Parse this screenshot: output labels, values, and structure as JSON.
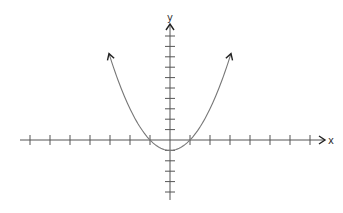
{
  "chart_data": {
    "type": "line",
    "title": "",
    "function": "y = x^2 - 1",
    "xlabel": "x",
    "ylabel": "y",
    "xlim": [
      -7.5,
      7.8
    ],
    "ylim": [
      -5.8,
      11
    ],
    "x_ticks": [
      -7,
      -6,
      -5,
      -4,
      -3,
      -2,
      -1,
      1,
      2,
      3,
      4,
      5,
      6,
      7
    ],
    "y_ticks": [
      -5,
      -4,
      -3,
      -2,
      -1,
      1,
      2,
      3,
      4,
      5,
      6,
      7,
      8,
      9,
      10
    ],
    "tick_labels_shown": false,
    "grid": false,
    "legend": null,
    "series": [
      {
        "name": "parabola",
        "x": [
          -3,
          -2,
          -1,
          0,
          1,
          2,
          3
        ],
        "y": [
          8,
          3,
          0,
          -1,
          0,
          3,
          8
        ],
        "arrows_at_ends": true
      }
    ],
    "key_points": {
      "vertex": [
        0,
        -1
      ],
      "x_intercepts": [
        [
          -1,
          0
        ],
        [
          1,
          0
        ]
      ]
    },
    "colors": {
      "axis": "#555555",
      "curve": "#777777",
      "arrow": "#222222"
    }
  },
  "labels": {
    "x_axis": "x",
    "y_axis": "y"
  }
}
